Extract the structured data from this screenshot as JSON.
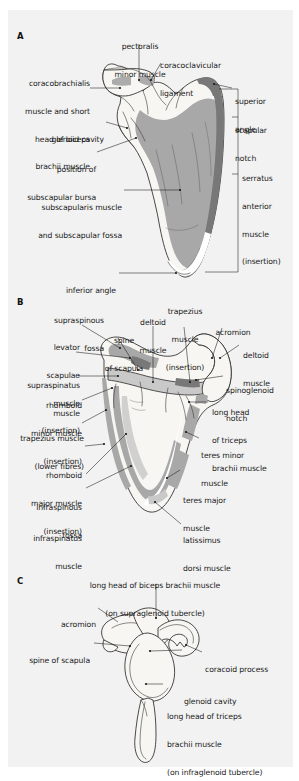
{
  "figure": {
    "background": "#f2f2f2",
    "page_background": "#ffffff",
    "ink": "#1a1a1a"
  },
  "palette": {
    "bone_light": "#f7f6f2",
    "bone_mid": "#a8a8a8",
    "bone_dark": "#787878",
    "bone_shade": "#c9c9c9",
    "outline": "#2b2b2b",
    "leader": "#1a1a1a"
  },
  "panels": [
    {
      "id": "A",
      "letter": "A",
      "view": "costal (anterior) surface of scapula",
      "labels": [
        {
          "name": "pectoralis-minor-muscle",
          "lines": [
            "pectoralis",
            "minor muscle"
          ],
          "align": "c"
        },
        {
          "name": "coracoclavicular-ligament",
          "lines": [
            "coracoclavicular",
            "ligament"
          ],
          "align": "l"
        },
        {
          "name": "coracobrachialis-and-short-head-biceps",
          "lines": [
            "coracobrachialis",
            "muscle and short",
            "head of biceps",
            "brachii muscle"
          ],
          "align": "r"
        },
        {
          "name": "glenoid-cavity",
          "lines": [
            "glenoid cavity"
          ],
          "align": "r"
        },
        {
          "name": "position-of-subscapular-bursa",
          "lines": [
            "position of",
            "subscapular bursa"
          ],
          "align": "r"
        },
        {
          "name": "subscapularis-muscle-and-fossa",
          "lines": [
            "subscapularis muscle",
            "and subscapular fossa"
          ],
          "align": "r"
        },
        {
          "name": "inferior-angle",
          "lines": [
            "inferior angle"
          ],
          "align": "r"
        },
        {
          "name": "superior-angle",
          "lines": [
            "superior",
            "angle"
          ],
          "align": "l"
        },
        {
          "name": "scapular-notch",
          "lines": [
            "scapular",
            "notch"
          ],
          "align": "l"
        },
        {
          "name": "serratus-anterior-muscle-insertion",
          "lines": [
            "serratus",
            "anterior",
            "muscle",
            "(insertion)"
          ],
          "align": "l"
        }
      ]
    },
    {
      "id": "B",
      "letter": "B",
      "view": "dorsal (posterior) surface of scapula",
      "labels": [
        {
          "name": "supraspinous-fossa",
          "lines": [
            "supraspinous",
            "fossa"
          ],
          "align": "r"
        },
        {
          "name": "levator-scapulae-muscle-insertion",
          "lines": [
            "levator",
            "scapulae",
            "muscle",
            "(insertion)"
          ],
          "align": "r"
        },
        {
          "name": "supraspinatus-muscle",
          "lines": [
            "supraspinatus",
            "muscle"
          ],
          "align": "r"
        },
        {
          "name": "rhomboid-minor-muscle-insertion",
          "lines": [
            "rhomboid",
            "minor muscle",
            "(insertion)"
          ],
          "align": "r"
        },
        {
          "name": "trapezius-muscle-lower-fibres",
          "lines": [
            "trapezius muscle",
            "(lower fibres)"
          ],
          "align": "r"
        },
        {
          "name": "rhomboid-major-muscle-insertion",
          "lines": [
            "rhomboid",
            "major muscle",
            "(insertion)"
          ],
          "align": "r"
        },
        {
          "name": "infraspinous-fossa",
          "lines": [
            "infraspinous",
            "fossa"
          ],
          "align": "r"
        },
        {
          "name": "infraspinatus-muscle",
          "lines": [
            "infraspinatus",
            "muscle"
          ],
          "align": "r"
        },
        {
          "name": "spine-of-scapula",
          "lines": [
            "spine",
            "of scapula"
          ],
          "align": "c"
        },
        {
          "name": "deltoid-muscle-left",
          "lines": [
            "deltoid",
            "muscle"
          ],
          "align": "c"
        },
        {
          "name": "trapezius-muscle-insertion",
          "lines": [
            "trapezius",
            "muscle",
            "(insertion)"
          ],
          "align": "c"
        },
        {
          "name": "acromion",
          "lines": [
            "acromion"
          ],
          "align": "c"
        },
        {
          "name": "deltoid-muscle-right",
          "lines": [
            "deltoid",
            "muscle"
          ],
          "align": "l"
        },
        {
          "name": "spinoglenoid-notch",
          "lines": [
            "spinoglenoid",
            "notch"
          ],
          "align": "l"
        },
        {
          "name": "long-head-of-triceps-brachii-muscle",
          "lines": [
            "long head",
            "of triceps",
            "brachii muscle"
          ],
          "align": "l"
        },
        {
          "name": "teres-minor-muscle",
          "lines": [
            "teres minor",
            "muscle"
          ],
          "align": "l"
        },
        {
          "name": "teres-major-muscle",
          "lines": [
            "teres major",
            "muscle"
          ],
          "align": "l"
        },
        {
          "name": "latissimus-dorsi-muscle",
          "lines": [
            "latissimus",
            "dorsi muscle"
          ],
          "align": "l"
        }
      ]
    },
    {
      "id": "C",
      "letter": "C",
      "view": "lateral view of scapula",
      "labels": [
        {
          "name": "long-head-of-biceps-brachii-muscle",
          "lines": [
            "long head of biceps brachii muscle",
            "(on supraglenoid tubercle)"
          ],
          "align": "c"
        },
        {
          "name": "acromion",
          "lines": [
            "acromion"
          ],
          "align": "r"
        },
        {
          "name": "spine-of-scapula",
          "lines": [
            "spine of scapula"
          ],
          "align": "r"
        },
        {
          "name": "coracoid-process",
          "lines": [
            "coracoid process"
          ],
          "align": "l"
        },
        {
          "name": "glenoid-cavity",
          "lines": [
            "glenoid cavity"
          ],
          "align": "l"
        },
        {
          "name": "long-head-of-triceps-brachii-muscle",
          "lines": [
            "long head of triceps",
            "brachii muscle",
            "(on infraglenoid tubercle)"
          ],
          "align": "l"
        }
      ]
    }
  ]
}
